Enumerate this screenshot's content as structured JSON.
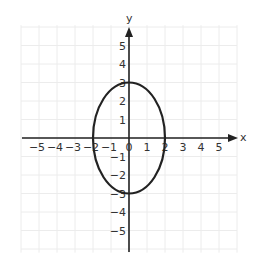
{
  "chart_data": {
    "type": "line",
    "title": "",
    "xlabel": "x",
    "ylabel": "y",
    "xlim": [
      -6,
      6
    ],
    "ylim": [
      -6,
      6
    ],
    "grid": true,
    "x_ticks": [
      -5,
      -4,
      -3,
      -2,
      -1,
      0,
      1,
      2,
      3,
      4,
      5
    ],
    "y_ticks": [
      -5,
      -4,
      -3,
      -2,
      -1,
      1,
      2,
      3,
      4,
      5
    ],
    "x_tick_labels": [
      "−5",
      "−4",
      "−3",
      "−2",
      "−1",
      "0",
      "1",
      "2",
      "3",
      "4",
      "5"
    ],
    "y_tick_labels": [
      "−5",
      "−4",
      "−3",
      "−2",
      "−1",
      "1",
      "2",
      "3",
      "4",
      "5"
    ],
    "series": [
      {
        "name": "ellipse",
        "shape": "ellipse",
        "equation": "x^2/4 + y^2/9 = 1",
        "center": [
          0,
          0
        ],
        "semi_axis_x": 2,
        "semi_axis_y": 3,
        "key_points": [
          [
            2,
            0
          ],
          [
            0,
            3
          ],
          [
            -2,
            0
          ],
          [
            0,
            -3
          ]
        ]
      }
    ]
  },
  "style": {
    "axis_color": "#222222",
    "curve_color": "#222222",
    "grid_color": "#ececec",
    "text_color": "#333333"
  }
}
